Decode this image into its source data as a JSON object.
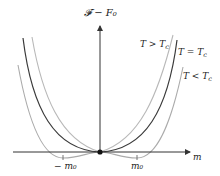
{
  "figure": {
    "type": "landau-free-energy-diagram",
    "y_axis_label": "𝓕 − F₀",
    "x_axis_label": "m",
    "ticks": {
      "neg_m0_label": "− m₀",
      "pos_m0_label": "m₀"
    },
    "curves": [
      {
        "id": "above",
        "label": "T > T",
        "sub": "c",
        "color": "#b4b4b4"
      },
      {
        "id": "critical",
        "label": "T = T",
        "sub": "c",
        "color": "#3a3a3a"
      },
      {
        "id": "below",
        "label": "T < T",
        "sub": "c",
        "color": "#a8a8a8"
      }
    ],
    "axis_color": "#333333",
    "origin_dot_color": "#111111"
  }
}
